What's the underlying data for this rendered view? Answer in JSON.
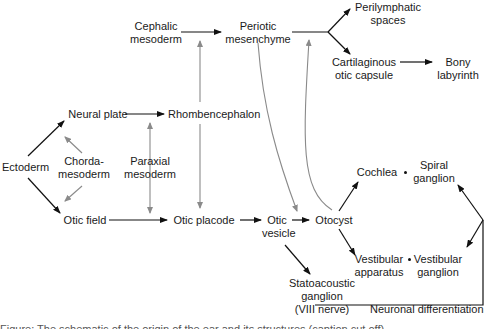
{
  "diagram": {
    "nodes": {
      "cephalic_mesoderm": "Cephalic\nmesoderm",
      "periotic_mesenchyme": "Periotic\nmesenchyme",
      "perilymphatic_spaces": "Perilymphatic\nspaces",
      "cartilaginous_otic_capsule": "Cartilaginous\notic capsule",
      "bony_labyrinth": "Bony\nlabyrinth",
      "neural_plate": "Neural plate",
      "rhombencephalon": "Rhombencephalon",
      "ectoderm": "Ectoderm",
      "chordamesoderm": "Chorda-\nmesoderm",
      "paraxial_mesoderm": "Paraxial\nmesoderm",
      "otic_field": "Otic field",
      "otic_placode": "Otic placode",
      "otic_vesicle": "Otic\nvesicle",
      "otocyst": "Otocyst",
      "cochlea": "Cochlea",
      "spiral_ganglion": "Spiral\nganglion",
      "vestibular_apparatus": "Vestibular\napparatus",
      "vestibular_ganglion": "Vestibular\nganglion",
      "statoacoustic_ganglion": "Statoacoustic\nganglion\n(VIII nerve)",
      "neuronal_differentiation": "Neuronal differentiation"
    },
    "caption_partial": "Figure: The schematic of the origin of the ear and its structures (caption cut off)",
    "colors": {
      "primary_arrow": "#111111",
      "induction_arrow": "#8a8a8a",
      "text": "#1a1a1a",
      "background": "#ffffff"
    }
  }
}
